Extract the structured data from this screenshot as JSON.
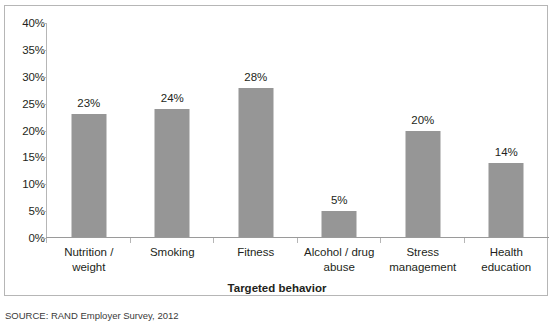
{
  "chart_data": {
    "type": "bar",
    "title": "",
    "xlabel": "Targeted behavior",
    "ylabel": "",
    "categories": [
      "Nutrition / weight",
      "Smoking",
      "Fitness",
      "Alcohol / drug abuse",
      "Stress management",
      "Health education"
    ],
    "category_lines": [
      [
        "Nutrition /",
        "weight"
      ],
      [
        "Smoking"
      ],
      [
        "Fitness"
      ],
      [
        "Alcohol / drug",
        "abuse"
      ],
      [
        "Stress",
        "management"
      ],
      [
        "Health",
        "education"
      ]
    ],
    "values": [
      23,
      24,
      28,
      5,
      20,
      14
    ],
    "value_labels": [
      "23%",
      "24%",
      "28%",
      "5%",
      "20%",
      "14%"
    ],
    "ylim": [
      0,
      40
    ],
    "ytick_values": [
      40,
      35,
      30,
      25,
      20,
      15,
      10,
      5,
      0
    ],
    "ytick_labels": [
      "40%",
      "35%",
      "30%",
      "25%",
      "20%",
      "15%",
      "10%",
      "5%",
      "0%"
    ],
    "grid": false,
    "legend": false,
    "bar_color": "#969696",
    "axis_color": "#b6b6b6",
    "frame_color": "#b6b6b6",
    "text_color": "#231f20"
  },
  "source": {
    "note": "SOURCE: RAND Employer Survey, 2012"
  }
}
